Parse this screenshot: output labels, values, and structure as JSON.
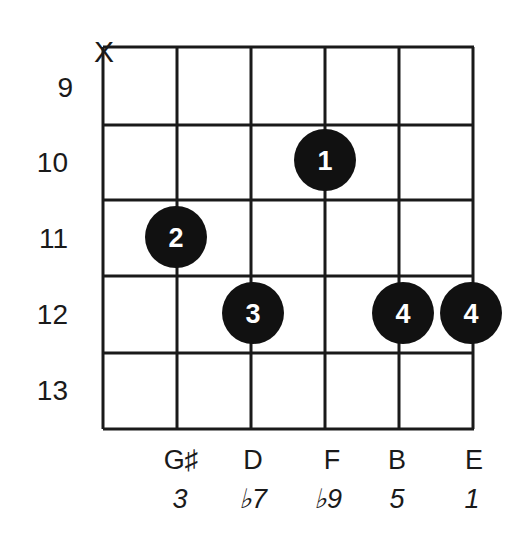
{
  "diagram": {
    "type": "guitar-chord-diagram",
    "muted_string_marker": "X",
    "fret_numbers": [
      "9",
      "10",
      "11",
      "12",
      "13"
    ],
    "strings": [
      {
        "index": 0,
        "note": "",
        "interval": "",
        "muted": true
      },
      {
        "index": 1,
        "note": "G♯",
        "interval": "3"
      },
      {
        "index": 2,
        "note": "D",
        "interval": "♭7"
      },
      {
        "index": 3,
        "note": "F",
        "interval": "♭9"
      },
      {
        "index": 4,
        "note": "B",
        "interval": "5"
      },
      {
        "index": 5,
        "note": "E",
        "interval": "1"
      }
    ],
    "fingers": [
      {
        "string": 3,
        "fret": "10",
        "finger": "1"
      },
      {
        "string": 1,
        "fret": "11",
        "finger": "2"
      },
      {
        "string": 2,
        "fret": "12",
        "finger": "3"
      },
      {
        "string": 4,
        "fret": "12",
        "finger": "4"
      },
      {
        "string": 5,
        "fret": "12",
        "finger": "4"
      }
    ],
    "colors": {
      "grid": "#1a1a1a",
      "dot": "#111111",
      "dot_text": "#ffffff",
      "background": "#ffffff"
    }
  }
}
